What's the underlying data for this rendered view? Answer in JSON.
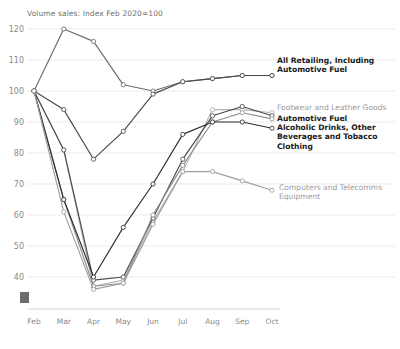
{
  "chart_data": {
    "type": "line",
    "title": "Volume sales: Index Feb 2020=100",
    "xlabel": "",
    "ylabel": "",
    "ylim": [
      35,
      123
    ],
    "yticks": [
      40,
      50,
      60,
      70,
      80,
      90,
      100,
      110,
      120
    ],
    "grid": true,
    "legend_position": "right-inline",
    "categories": [
      "Feb",
      "Mar",
      "Apr",
      "May",
      "Jun",
      "Jul",
      "Aug",
      "Sep",
      "Oct"
    ],
    "series": [
      {
        "name": "Food Stores",
        "label_shown": false,
        "color": "#6b6b6b",
        "values": [
          100,
          120,
          116,
          102,
          100,
          103,
          104,
          105,
          105
        ]
      },
      {
        "name": "All Retailing, Including Automotive Fuel",
        "label_shown": true,
        "color": "#4a4a4a",
        "values": [
          100,
          94,
          78,
          87,
          99,
          103,
          104,
          105,
          105
        ]
      },
      {
        "name": "Footwear and Leather Goods",
        "label_shown": true,
        "color": "#b4b4b4",
        "values": [
          100,
          81,
          37,
          39,
          58,
          74,
          94,
          94,
          93
        ]
      },
      {
        "name": "Automotive Fuel",
        "label_shown": true,
        "color": "#4a4a4a",
        "values": [
          100,
          81,
          39,
          40,
          59,
          78,
          92,
          95,
          92
        ]
      },
      {
        "name": "Alcoholic Drinks, Other Beverages and Tobacco",
        "label_shown": true,
        "color": "#8f8f8f",
        "values": [
          100,
          65,
          37,
          38,
          60,
          76,
          90,
          93,
          91
        ]
      },
      {
        "name": "Clothing",
        "label_shown": true,
        "color": "#2e2e2e",
        "values": [
          100,
          65,
          40,
          56,
          70,
          86,
          90,
          90,
          88
        ]
      },
      {
        "name": "Computers and Telecomms Equipment",
        "label_shown": true,
        "color": "#9e9e9e",
        "values": [
          100,
          61,
          36,
          38,
          57,
          74,
          74,
          71,
          68
        ]
      }
    ],
    "annotations": [
      {
        "id": "label-all-retailing",
        "text_lines": [
          "All Retailing, Including",
          "Automotive Fuel"
        ],
        "style": "bold"
      },
      {
        "id": "label-footwear",
        "text_lines": [
          "Footwear and Leather Goods"
        ],
        "style": "grey"
      },
      {
        "id": "label-automotive-fuel",
        "text_lines": [
          "Automotive Fuel"
        ],
        "style": "bold"
      },
      {
        "id": "label-alcoholic-drinks",
        "text_lines": [
          "Alcoholic Drinks, Other",
          "Beverages and Tobacco"
        ],
        "style": "bold"
      },
      {
        "id": "label-clothing",
        "text_lines": [
          "Clothing"
        ],
        "style": "bold"
      },
      {
        "id": "label-computers",
        "text_lines": [
          "Computers and Telecomms",
          "Equipment"
        ],
        "style": "grey"
      }
    ]
  },
  "axis": {
    "yticks": [
      "120",
      "110",
      "100",
      "90",
      "80",
      "70",
      "60",
      "50",
      "40"
    ],
    "xticks": [
      "Feb",
      "Mar",
      "Apr",
      "May",
      "Jun",
      "Jul",
      "Aug",
      "Sep",
      "Oct"
    ]
  },
  "labels": {
    "title": "Volume sales: Index Feb 2020=100",
    "all_retailing_l1": "All Retailing, Including",
    "all_retailing_l2": "Automotive Fuel",
    "footwear": "Footwear and Leather Goods",
    "automotive_fuel": "Automotive Fuel",
    "alcoholic_l1": "Alcoholic Drinks, Other",
    "alcoholic_l2": "Beverages and Tobacco",
    "clothing": "Clothing",
    "computers_l1": "Computers and Telecomms",
    "computers_l2": "Equipment"
  },
  "colors": {
    "gridline": "#e6e6e6",
    "axis": "#cfcfcf",
    "tick_text": "#8a8a8a",
    "title_text": "#6f6f6f",
    "marker_square": "#6d6d6d"
  }
}
